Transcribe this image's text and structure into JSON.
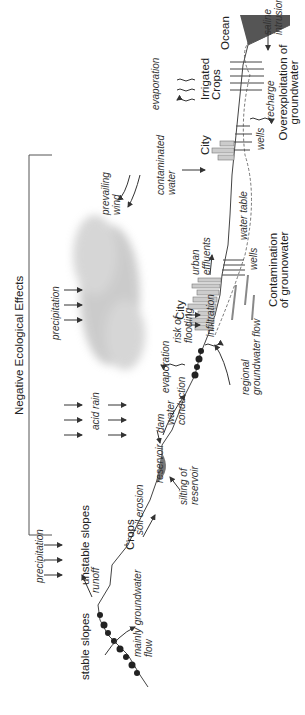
{
  "diagram": {
    "title": "Negative Ecological Effects",
    "orientation": "rotated 90 degrees counter-clockwise",
    "zones": {
      "left": "stable slopes",
      "left_flow": "mainly groundwater flow",
      "unstable": "unstable slopes",
      "crops": "Crops",
      "city1": "City",
      "city2": "City",
      "irrigated": "Irrigated Crops",
      "ocean": "Ocean"
    },
    "processes": {
      "precipitation1": "precipitation",
      "runoff": "runoff",
      "soil_erosion": "soil erosion",
      "reservoir": "reservoir",
      "silting": "silting of reservoir",
      "dam": "dam",
      "acid_rain": "acid rain",
      "water_conduction": "water conduction",
      "evaporation1": "evaporation",
      "precipitation2": "precipitation",
      "risk_flooding": "risk of flooding",
      "infiltration": "infiltration",
      "regional_flow": "regional groundwater flow",
      "prevailing_wind": "prevailing wind",
      "urban_effluents": "urban effluents",
      "wells1": "wells",
      "water_table": "water table",
      "contaminated_water": "contaminated water",
      "wells2": "wells",
      "evaporation2": "evaporation",
      "recharge": "recharge",
      "saline_intrusion": "saline intrusion"
    },
    "effects": {
      "contamination": "Contamination of grounowater",
      "overexploitation": "Overexploitation of groundwater"
    },
    "colors": {
      "line": "#444444",
      "smog": "#bbbbbb",
      "ocean": "#555555",
      "reservoir": "#777777"
    }
  }
}
